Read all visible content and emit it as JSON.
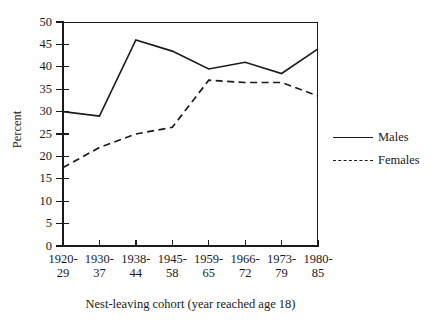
{
  "chart_data": {
    "type": "line",
    "title": "",
    "xlabel": "Nest-leaving cohort (year reached age 18)",
    "ylabel": "Percent",
    "categories": [
      "1920-\n29",
      "1930-\n37",
      "1938-\n44",
      "1945-\n58",
      "1959-\n65",
      "1966-\n72",
      "1973-\n79",
      "1980-\n85"
    ],
    "category_lines": [
      {
        "line1": "1920-",
        "line2": "29"
      },
      {
        "line1": "1930-",
        "line2": "37"
      },
      {
        "line1": "1938-",
        "line2": "44"
      },
      {
        "line1": "1945-",
        "line2": "58"
      },
      {
        "line1": "1959-",
        "line2": "65"
      },
      {
        "line1": "1966-",
        "line2": "72"
      },
      {
        "line1": "1973-",
        "line2": "79"
      },
      {
        "line1": "1980-",
        "line2": "85"
      }
    ],
    "series": [
      {
        "name": "Males",
        "style": "solid",
        "color": "#1a1a1a",
        "values": [
          30,
          29,
          46,
          43.5,
          39.5,
          41,
          38.5,
          44
        ]
      },
      {
        "name": "Females",
        "style": "dashed",
        "color": "#1a1a1a",
        "values": [
          17.5,
          22,
          25,
          26.5,
          37,
          36.5,
          36.5,
          33.5
        ]
      }
    ],
    "ylim": [
      0,
      50
    ],
    "yticks": [
      0,
      5,
      10,
      15,
      20,
      25,
      30,
      35,
      40,
      45,
      50
    ],
    "ytick_labels": [
      "0",
      "5",
      "10",
      "15",
      "20",
      "25",
      "30",
      "35",
      "40",
      "45",
      "50"
    ],
    "grid": false,
    "legend_position": "right",
    "legend_entries": [
      "Males",
      "Females"
    ]
  },
  "legend": {
    "males_label": "Males",
    "females_label": "Females"
  },
  "axes": {
    "y_title": "Percent",
    "x_title": "Nest-leaving cohort (year reached age 18)"
  },
  "colors": {
    "ink": "#1a1a1a",
    "background": "#ffffff"
  }
}
